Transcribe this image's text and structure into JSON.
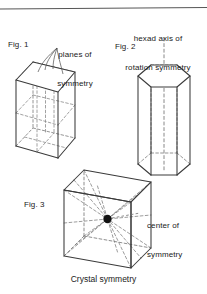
{
  "figure": {
    "caption": "Crystal symmetry",
    "background_color": "#ffffff",
    "line_color": "#3a3a3a",
    "dashed_color": "#6e6e6e",
    "text_color": "#1a1a1a",
    "top_rule": true,
    "panels": [
      {
        "id": "fig1",
        "label": "Fig. 1",
        "annotation": "planes of\nsymmetry",
        "annotation_line1": "planes of",
        "annotation_line2": "symmetry",
        "shape": "rectangular prism",
        "shape_icon": "cuboid-icon",
        "leader_lines": 4
      },
      {
        "id": "fig2",
        "label": "Fig. 2",
        "annotation": "hexad axis of\nrotation symmetry",
        "annotation_line1": "hexad axis of",
        "annotation_line2": "rotation symmetry",
        "shape": "hexagonal prism",
        "shape_icon": "hexagonal-prism-icon",
        "leader_lines": 1
      },
      {
        "id": "fig3",
        "label": "Fig. 3",
        "annotation": "center of\nsymmetry",
        "annotation_line1": "center of",
        "annotation_line2": "symmetry",
        "shape": "cube",
        "shape_icon": "cube-icon",
        "center_point": true,
        "leader_lines": 1
      }
    ]
  }
}
